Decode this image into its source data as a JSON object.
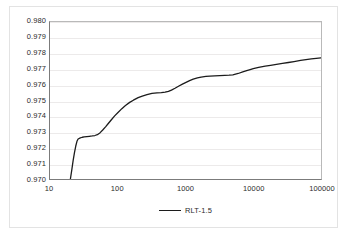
{
  "chart_data": {
    "type": "line",
    "title": "",
    "xlabel": "",
    "ylabel": "",
    "xscale": "log",
    "xlim": [
      10,
      100000
    ],
    "ylim": [
      0.97,
      0.98
    ],
    "grid": true,
    "legend_position": "bottom",
    "x_ticks": [
      "10",
      "100",
      "1000",
      "10000",
      "100000"
    ],
    "x_tick_values": [
      10,
      100,
      1000,
      10000,
      100000
    ],
    "y_ticks": [
      "0.970",
      "0.971",
      "0.972",
      "0.973",
      "0.974",
      "0.975",
      "0.976",
      "0.977",
      "0.978",
      "0.979",
      "0.980"
    ],
    "y_tick_values": [
      0.97,
      0.971,
      0.972,
      0.973,
      0.974,
      0.975,
      0.976,
      0.977,
      0.978,
      0.979,
      0.98
    ],
    "series": [
      {
        "name": "RLT-1.5",
        "color": "#1c1c1c",
        "x": [
          20,
          21,
          22,
          23,
          24,
          25,
          26,
          28,
          30,
          32,
          35,
          38,
          42,
          46,
          50,
          55,
          60,
          66,
          72,
          80,
          90,
          100,
          115,
          130,
          150,
          170,
          200,
          230,
          270,
          320,
          380,
          440,
          500,
          560,
          620,
          700,
          800,
          900,
          1000,
          1150,
          1300,
          1500,
          1700,
          2000,
          2300,
          2700,
          3200,
          3800,
          4400,
          5000,
          6000,
          7000,
          8000,
          9000,
          10000,
          12000,
          15000,
          18000,
          22000,
          27000,
          33000,
          40000,
          50000,
          60000,
          72000,
          85000,
          100000
        ],
        "y": [
          0.97,
          0.9706,
          0.9712,
          0.9717,
          0.9721,
          0.9724,
          0.97255,
          0.97262,
          0.97266,
          0.97268,
          0.9727,
          0.97272,
          0.97274,
          0.97277,
          0.97282,
          0.97295,
          0.97312,
          0.97332,
          0.97352,
          0.97376,
          0.97402,
          0.97422,
          0.97448,
          0.97468,
          0.97488,
          0.97502,
          0.97518,
          0.97528,
          0.97538,
          0.97545,
          0.97548,
          0.9755,
          0.97553,
          0.97558,
          0.97566,
          0.97578,
          0.97592,
          0.97604,
          0.97614,
          0.97627,
          0.97636,
          0.97644,
          0.97649,
          0.97653,
          0.97655,
          0.97657,
          0.97659,
          0.9766,
          0.97661,
          0.97663,
          0.97672,
          0.97682,
          0.9769,
          0.97697,
          0.97703,
          0.97711,
          0.97719,
          0.97724,
          0.9773,
          0.97736,
          0.97742,
          0.97748,
          0.97755,
          0.9776,
          0.97765,
          0.97769,
          0.97772
        ]
      }
    ]
  },
  "legend": {
    "label": "RLT-1.5"
  }
}
